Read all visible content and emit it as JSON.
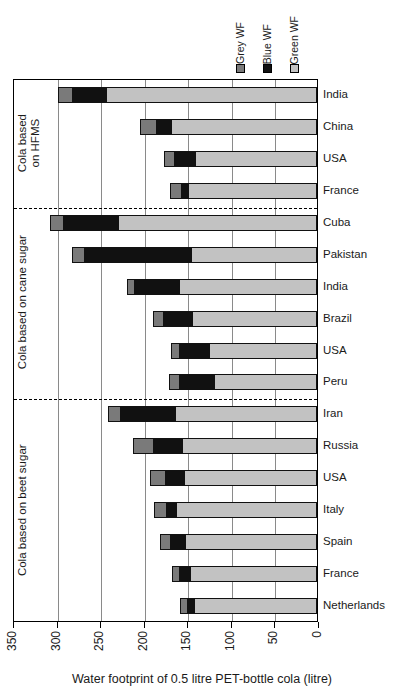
{
  "chart": {
    "type": "bar",
    "orientation": "horizontal-stacked-reversed",
    "xlabel": "Water footprint of 0.5 litre PET-bottle cola (litre)",
    "xlim": [
      350,
      0
    ],
    "xticks": [
      350,
      300,
      250,
      200,
      150,
      100,
      50,
      0
    ],
    "grid": true,
    "legend_position": "top-right",
    "legend": [
      {
        "key": "grey",
        "label": "Grey WF",
        "color": "#7a7a7a"
      },
      {
        "key": "blue",
        "label": "Blue WF",
        "color": "#111111"
      },
      {
        "key": "green",
        "label": "Green WF",
        "color": "#c2c2c2"
      }
    ],
    "groups": [
      {
        "label": "Cola based\non HFMS",
        "count": 4
      },
      {
        "label": "Cola based on cane sugar",
        "count": 6
      },
      {
        "label": "Cola based on beet sugar",
        "count": 7
      }
    ],
    "categories": [
      "India",
      "China",
      "USA",
      "France",
      "Cuba",
      "Pakistan",
      "India",
      "Brazil",
      "USA",
      "Peru",
      "Iran",
      "Russia",
      "USA",
      "Italy",
      "Spain",
      "France",
      "Netherlands"
    ],
    "series": [
      {
        "name": "Grey WF",
        "values": [
          18,
          19,
          13,
          14,
          16,
          14,
          9,
          12,
          10,
          12,
          15,
          24,
          18,
          15,
          13,
          10,
          9
        ]
      },
      {
        "name": "Blue WF",
        "values": [
          40,
          18,
          25,
          9,
          65,
          125,
          53,
          34,
          36,
          42,
          64,
          34,
          23,
          12,
          18,
          13,
          9
        ]
      },
      {
        "name": "Green WF",
        "values": [
          242,
          168,
          140,
          148,
          228,
          144,
          158,
          144,
          124,
          118,
          163,
          155,
          153,
          162,
          152,
          146,
          141
        ]
      }
    ],
    "totals": [
      300,
      205,
      178,
      171,
      309,
      283,
      220,
      190,
      170,
      172,
      242,
      213,
      194,
      189,
      183,
      169,
      159
    ],
    "chart_data": {
      "type": "bar",
      "title": "",
      "xlabel": "Water footprint of 0.5 litre PET-bottle cola (litre)",
      "ylabel": "",
      "xlim": [
        350,
        0
      ],
      "grid": true,
      "stacked": true,
      "categories": [
        "India",
        "China",
        "USA",
        "France",
        "Cuba",
        "Pakistan",
        "India",
        "Brazil",
        "USA",
        "Peru",
        "Iran",
        "Russia",
        "USA",
        "Italy",
        "Spain",
        "France",
        "Netherlands"
      ],
      "series": [
        {
          "name": "Grey WF",
          "values": [
            18,
            19,
            13,
            14,
            16,
            14,
            9,
            12,
            10,
            12,
            15,
            24,
            18,
            15,
            13,
            10,
            9
          ]
        },
        {
          "name": "Blue WF",
          "values": [
            40,
            18,
            25,
            9,
            65,
            125,
            53,
            34,
            36,
            42,
            64,
            34,
            23,
            12,
            18,
            13,
            9
          ]
        },
        {
          "name": "Green WF",
          "values": [
            242,
            168,
            140,
            148,
            228,
            144,
            158,
            144,
            124,
            118,
            163,
            155,
            153,
            162,
            152,
            146,
            141
          ]
        }
      ]
    }
  }
}
